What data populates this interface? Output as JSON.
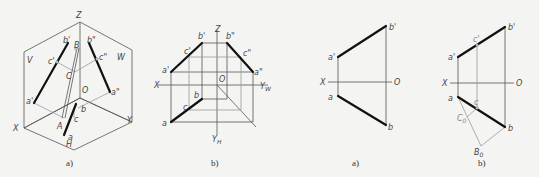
{
  "figures": [
    {
      "id": "fig1a",
      "caption": "a)",
      "description": "Isometric view of line AB in three projection planes V, H, W with point C on it",
      "labels": {
        "Z": "Z",
        "V": "V",
        "W": "W",
        "X": "X",
        "Y": "Y",
        "H": "H",
        "O": "O",
        "a_prime": "a'",
        "b_prime": "b'",
        "c_prime": "c'",
        "a_dprime": "a\"",
        "b_dprime": "b\"",
        "c_dprime": "c\"",
        "A": "A",
        "B": "B",
        "C": "C",
        "a": "a",
        "b": "b",
        "c": "c"
      }
    },
    {
      "id": "fig1b",
      "caption": "b)",
      "description": "Three-view orthographic projection of line AB with point C",
      "labels": {
        "Z": "Z",
        "X": "X",
        "O": "O",
        "Y_W": "Y",
        "Y_W_sub": "W",
        "Y_H": "Y",
        "Y_H_sub": "H",
        "a_prime": "a'",
        "b_prime": "b'",
        "c_prime": "c'",
        "a_dprime": "a\"",
        "b_dprime": "b\"",
        "c_dprime": "c\"",
        "a": "a",
        "b": "b",
        "c": "c"
      }
    },
    {
      "id": "fig2a",
      "caption": "a)",
      "description": "Two-view projection of line AB",
      "labels": {
        "X": "X",
        "O": "O",
        "a_prime": "a'",
        "b_prime": "b'",
        "a": "a",
        "b": "b"
      }
    },
    {
      "id": "fig2b",
      "caption": "b)",
      "description": "Two-view projection of AB with point C located by proportional division construction",
      "labels": {
        "X": "X",
        "O": "O",
        "a_prime": "a'",
        "b_prime": "b'",
        "c_prime": "c'",
        "a": "a",
        "b": "b",
        "c": "c",
        "C0": "C",
        "C0_sub": "0",
        "B0": "B",
        "B0_sub": "0"
      }
    }
  ]
}
